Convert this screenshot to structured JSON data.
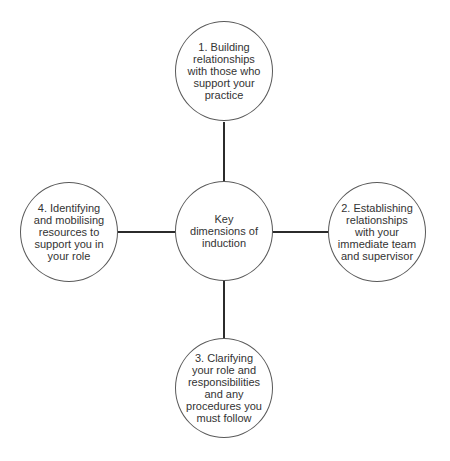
{
  "diagram": {
    "title": "Key dimensions of induction",
    "center": {
      "label": "Key dimensions of induction",
      "lines": [
        "Key",
        "dimensions of",
        "induction"
      ]
    },
    "nodes": [
      {
        "id": 1,
        "position": "top",
        "lines": [
          "1. Building",
          "relationships",
          "with those who",
          "support your",
          "practice"
        ]
      },
      {
        "id": 2,
        "position": "right",
        "lines": [
          "2. Establishing",
          "relationships",
          "with your",
          "immediate team",
          "and supervisor"
        ]
      },
      {
        "id": 3,
        "position": "bottom",
        "lines": [
          "3. Clarifying",
          "your role and",
          "responsibilities",
          "and any",
          "procedures you",
          "must follow"
        ]
      },
      {
        "id": 4,
        "position": "left",
        "lines": [
          "4. Identifying",
          "and mobilising",
          "resources to",
          "support you in",
          "your role"
        ]
      }
    ],
    "colors": {
      "line": "#2b2b2b",
      "circle_border": "#5a5a5a",
      "text": "#333333",
      "background": "#ffffff"
    }
  }
}
